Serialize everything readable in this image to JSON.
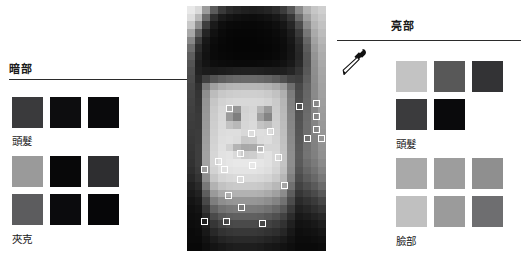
{
  "canvas": {
    "width": 528,
    "height": 261,
    "background": "#ffffff"
  },
  "sections": {
    "dark": {
      "heading": "暗部",
      "groups": [
        {
          "label": "頭髮",
          "rows": [
            [
              "#3a3a3c",
              "#0d0d0f",
              "#0a0a0c"
            ]
          ]
        },
        {
          "label": "夾克",
          "rows": [
            [
              "#9a9a9a",
              "#080809",
              "#2e2e30"
            ],
            [
              "#5c5c5e",
              "#0b0b0d",
              "#060608"
            ]
          ]
        }
      ]
    },
    "light": {
      "heading": "亮部",
      "groups": [
        {
          "label": "頭髮",
          "rows": [
            [
              "#c3c3c3",
              "#585858",
              "#333335"
            ],
            [
              "#3b3b3d",
              "#0a0a0c"
            ]
          ]
        },
        {
          "label": "臉部",
          "rows": [
            [
              "#a9a9a9",
              "#9d9d9d",
              "#8f8f8f"
            ],
            [
              "#c0c0c0",
              "#9b9b9b",
              "#6e6e70"
            ]
          ]
        }
      ]
    }
  },
  "portrait": {
    "name": "pixelated-portrait",
    "columns": 18,
    "rows": 32,
    "pixels": [
      "#e9e9e9",
      "#dadada",
      "#9b9b9b",
      "#5b5b5b",
      "#3a3a3a",
      "#2a2a2a",
      "#242424",
      "#202020",
      "#1e1e1e",
      "#202020",
      "#242424",
      "#2c2c2c",
      "#3c3c3c",
      "#565656",
      "#8a8a8a",
      "#b2b2b2",
      "#c6c6c6",
      "#cfcfcf",
      "#dedede",
      "#b9b9b9",
      "#6a6a6a",
      "#2f2f2f",
      "#1b1b1b",
      "#141414",
      "#101010",
      "#0e0e0e",
      "#0d0d0d",
      "#0f0f0f",
      "#121212",
      "#181818",
      "#222222",
      "#363636",
      "#6a6a6a",
      "#9e9e9e",
      "#bdbdbd",
      "#c8c8c8",
      "#c8c8c8",
      "#8f8f8f",
      "#3d3d3d",
      "#1a1a1a",
      "#0e0e0e",
      "#0a0a0a",
      "#090909",
      "#080808",
      "#080808",
      "#090909",
      "#0b0b0b",
      "#0f0f0f",
      "#161616",
      "#262626",
      "#4c4c4c",
      "#8a8a8a",
      "#b4b4b4",
      "#c2c2c2",
      "#a8a8a8",
      "#5f5f5f",
      "#242424",
      "#111111",
      "#0a0a0a",
      "#070707",
      "#060606",
      "#060606",
      "#060606",
      "#070707",
      "#080808",
      "#0b0b0b",
      "#101010",
      "#1c1c1c",
      "#3a3a3a",
      "#767676",
      "#aaaaaa",
      "#bcbcbc",
      "#888888",
      "#3e3e3e",
      "#181818",
      "#0c0c0c",
      "#080808",
      "#060606",
      "#050505",
      "#050505",
      "#050505",
      "#060606",
      "#070707",
      "#090909",
      "#0d0d0d",
      "#171717",
      "#2f2f2f",
      "#666666",
      "#a2a2a2",
      "#b6b6b6",
      "#6e6e6e",
      "#2c2c2c",
      "#141414",
      "#0a0a0a",
      "#070707",
      "#060606",
      "#050505",
      "#050505",
      "#050505",
      "#050505",
      "#060606",
      "#080808",
      "#0c0c0c",
      "#141414",
      "#292929",
      "#5c5c5c",
      "#9a9a9a",
      "#b0b0b0",
      "#5e5e5e",
      "#242424",
      "#121212",
      "#0a0a0a",
      "#080808",
      "#070707",
      "#060606",
      "#060606",
      "#060606",
      "#060606",
      "#070707",
      "#090909",
      "#0d0d0d",
      "#151515",
      "#272727",
      "#565656",
      "#949494",
      "#acacac",
      "#545454",
      "#202020",
      "#141414",
      "#0e0e0e",
      "#0c0c0c",
      "#0b0b0b",
      "#0a0a0a",
      "#0a0a0a",
      "#0a0a0a",
      "#0b0b0b",
      "#0c0c0c",
      "#0e0e0e",
      "#121212",
      "#191919",
      "#2a2a2a",
      "#545454",
      "#909090",
      "#a9a9a9",
      "#4e4e4e",
      "#222222",
      "#1c1c1c",
      "#1a1a1a",
      "#1c1c1c",
      "#1e1e1e",
      "#202020",
      "#212121",
      "#212121",
      "#202020",
      "#1e1e1e",
      "#1d1d1d",
      "#1f1f1f",
      "#252525",
      "#343434",
      "#585858",
      "#8e8e8e",
      "#a6a6a6",
      "#4a4a4a",
      "#282828",
      "#404040",
      "#545454",
      "#5e5e5e",
      "#646464",
      "#686868",
      "#6a6a6a",
      "#6a6a6a",
      "#686868",
      "#646464",
      "#5c5c5c",
      "#505050",
      "#424242",
      "#3e3e3e",
      "#5e5e5e",
      "#8c8c8c",
      "#a4a4a4",
      "#464646",
      "#303030",
      "#7a7a7a",
      "#a0a0a0",
      "#aeaeae",
      "#b4b4b4",
      "#b6b6b6",
      "#b7b7b7",
      "#b7b7b7",
      "#b6b6b6",
      "#b2b2b2",
      "#aaaaaa",
      "#9a9a9a",
      "#6e6e6e",
      "#484848",
      "#646464",
      "#8a8a8a",
      "#a2a2a2",
      "#444444",
      "#343434",
      "#8e8e8e",
      "#bcbcbc",
      "#c8c8c8",
      "#cccccc",
      "#cecece",
      "#cfcfcf",
      "#cfcfcf",
      "#cecece",
      "#cacaca",
      "#c2c2c2",
      "#b0b0b0",
      "#7c7c7c",
      "#4c4c4c",
      "#666666",
      "#8a8a8a",
      "#a0a0a0",
      "#424242",
      "#363636",
      "#949494",
      "#c6c6c6",
      "#d2d2d2",
      "#d6d6d6",
      "#d8d8d8",
      "#d8d8d8",
      "#d8d8d8",
      "#d7d7d7",
      "#d3d3d3",
      "#cacaca",
      "#b6b6b6",
      "#808080",
      "#4e4e4e",
      "#686868",
      "#888888",
      "#9e9e9e",
      "#404040",
      "#383838",
      "#969696",
      "#cacaca",
      "#d6d6d6",
      "#b0b0b0",
      "#969696",
      "#d2d2d2",
      "#d6d6d6",
      "#b6b6b6",
      "#9a9a9a",
      "#cccccc",
      "#b8b8b8",
      "#828282",
      "#505050",
      "#6a6a6a",
      "#868686",
      "#9c9c9c",
      "#3e3e3e",
      "#3a3a3a",
      "#989898",
      "#cccccc",
      "#d8d8d8",
      "#9a9a9a",
      "#7e7e7e",
      "#d4d4d4",
      "#d8d8d8",
      "#a0a0a0",
      "#848484",
      "#cecece",
      "#bababa",
      "#848484",
      "#525252",
      "#6c6c6c",
      "#858585",
      "#9a9a9a",
      "#3c3c3c",
      "#3a3a3a",
      "#9a9a9a",
      "#cecece",
      "#dadada",
      "#c2c2c2",
      "#b8b8b8",
      "#d6d6d6",
      "#dadada",
      "#c4c4c4",
      "#bcbcbc",
      "#d0d0d0",
      "#bcbcbc",
      "#868686",
      "#545454",
      "#6e6e6e",
      "#848484",
      "#989898",
      "#3a3a3a",
      "#3c3c3c",
      "#9c9c9c",
      "#d0d0d0",
      "#dcdcdc",
      "#dedede",
      "#dedede",
      "#d8d8d8",
      "#dcdcdc",
      "#dedede",
      "#dcdcdc",
      "#d2d2d2",
      "#bebebe",
      "#888888",
      "#565656",
      "#6e6e6e",
      "#838383",
      "#969696",
      "#383838",
      "#3c3c3c",
      "#9e9e9e",
      "#d2d2d2",
      "#dedede",
      "#e0e0e0",
      "#dcdcdc",
      "#c8c8c8",
      "#cacaca",
      "#dcdcdc",
      "#dedede",
      "#d4d4d4",
      "#c0c0c0",
      "#8a8a8a",
      "#585858",
      "#707070",
      "#828282",
      "#949494",
      "#363636",
      "#3e3e3e",
      "#a0a0a0",
      "#d4d4d4",
      "#e0e0e0",
      "#d2d2d2",
      "#b4b4b4",
      "#a8a8a8",
      "#aaaaaa",
      "#b8b8b8",
      "#d6d6d6",
      "#d6d6d6",
      "#c2c2c2",
      "#8c8c8c",
      "#5a5a5a",
      "#727272",
      "#818181",
      "#929292",
      "#343434",
      "#3e3e3e",
      "#a2a2a2",
      "#d6d6d6",
      "#e2e2e2",
      "#e4e4e4",
      "#dadada",
      "#cccccc",
      "#cecece",
      "#dcdcdc",
      "#e2e2e2",
      "#d8d8d8",
      "#c4c4c4",
      "#8e8e8e",
      "#5c5c5c",
      "#747474",
      "#808080",
      "#909090",
      "#323232",
      "#3e3e3e",
      "#a2a2a2",
      "#d6d6d6",
      "#e2e2e2",
      "#e6e6e6",
      "#e8e8e8",
      "#e8e8e8",
      "#e8e8e8",
      "#e6e6e6",
      "#e2e2e2",
      "#d8d8d8",
      "#c4c4c4",
      "#8e8e8e",
      "#5a5a5a",
      "#6e6e6e",
      "#7a7a7a",
      "#8a8a8a",
      "#2e2e2e",
      "#3a3a3a",
      "#9c9c9c",
      "#d2d2d2",
      "#dedede",
      "#e2e2e2",
      "#e4e4e4",
      "#e4e4e4",
      "#e4e4e4",
      "#e2e2e2",
      "#dedede",
      "#d4d4d4",
      "#c0c0c0",
      "#8a8a8a",
      "#545454",
      "#666666",
      "#727272",
      "#828282",
      "#282828",
      "#343434",
      "#8e8e8e",
      "#c6c6c6",
      "#d4d4d4",
      "#d8d8d8",
      "#dadada",
      "#dadada",
      "#dadada",
      "#d8d8d8",
      "#d4d4d4",
      "#cacaca",
      "#b6b6b6",
      "#808080",
      "#4c4c4c",
      "#5c5c5c",
      "#686868",
      "#787878",
      "#202020",
      "#2a2a2a",
      "#787878",
      "#b2b2b2",
      "#c2c2c2",
      "#c8c8c8",
      "#cacaca",
      "#cacaca",
      "#cacaca",
      "#c8c8c8",
      "#c2c2c2",
      "#b8b8b8",
      "#a4a4a4",
      "#707070",
      "#424242",
      "#4e4e4e",
      "#5a5a5a",
      "#6a6a6a",
      "#1a1a1a",
      "#222222",
      "#5e5e5e",
      "#9a9a9a",
      "#aaaaaa",
      "#b0b0b0",
      "#b2b2b2",
      "#b2b2b2",
      "#b2b2b2",
      "#b0b0b0",
      "#aaaaaa",
      "#a0a0a0",
      "#8c8c8c",
      "#5e5e5e",
      "#363636",
      "#404040",
      "#4a4a4a",
      "#585858",
      "#141414",
      "#1a1a1a",
      "#484848",
      "#7e7e7e",
      "#8e8e8e",
      "#949494",
      "#969696",
      "#969696",
      "#969696",
      "#949494",
      "#8e8e8e",
      "#848484",
      "#727272",
      "#4c4c4c",
      "#2a2a2a",
      "#323232",
      "#3a3a3a",
      "#464646",
      "#101010",
      "#141414",
      "#363636",
      "#626262",
      "#727272",
      "#787878",
      "#7a7a7a",
      "#7a7a7a",
      "#7a7a7a",
      "#787878",
      "#727272",
      "#686868",
      "#585858",
      "#3a3a3a",
      "#202020",
      "#262626",
      "#2e2e2e",
      "#363636",
      "#0e0e0e",
      "#101010",
      "#282828",
      "#4a4a4a",
      "#585858",
      "#5e5e5e",
      "#606060",
      "#606060",
      "#606060",
      "#5e5e5e",
      "#585858",
      "#505050",
      "#424242",
      "#2c2c2c",
      "#181818",
      "#1c1c1c",
      "#222222",
      "#282828",
      "#0c0c0c",
      "#0e0e0e",
      "#1e1e1e",
      "#363636",
      "#424242",
      "#484848",
      "#4a4a4a",
      "#4a4a4a",
      "#4a4a4a",
      "#484848",
      "#424242",
      "#3c3c3c",
      "#323232",
      "#202020",
      "#121212",
      "#141414",
      "#181818",
      "#1e1e1e",
      "#0a0a0a",
      "#0c0c0c",
      "#181818",
      "#282828",
      "#323232",
      "#363636",
      "#383838",
      "#383838",
      "#383838",
      "#363636",
      "#323232",
      "#2e2e2e",
      "#262626",
      "#181818",
      "#0e0e0e",
      "#101010",
      "#121212",
      "#161616",
      "#0a0a0a",
      "#0a0a0a",
      "#121212",
      "#1c1c1c",
      "#242424",
      "#282828",
      "#2a2a2a",
      "#2a2a2a",
      "#2a2a2a",
      "#282828",
      "#242424",
      "#202020",
      "#1a1a1a",
      "#121212",
      "#0c0c0c",
      "#0c0c0c",
      "#0e0e0e",
      "#101010",
      "#080808",
      "#080808",
      "#0e0e0e",
      "#141414",
      "#181818",
      "#1c1c1c",
      "#1e1e1e",
      "#1e1e1e",
      "#1e1e1e",
      "#1c1c1c",
      "#181818",
      "#161616",
      "#121212",
      "#0e0e0e",
      "#0a0a0a",
      "#0a0a0a",
      "#0a0a0a",
      "#0c0c0c"
    ],
    "markers": [
      {
        "x": 39,
        "y": 99
      },
      {
        "x": 109,
        "y": 97
      },
      {
        "x": 126,
        "y": 94
      },
      {
        "x": 126,
        "y": 107
      },
      {
        "x": 126,
        "y": 120
      },
      {
        "x": 117,
        "y": 129
      },
      {
        "x": 131,
        "y": 129
      },
      {
        "x": 61,
        "y": 124
      },
      {
        "x": 80,
        "y": 122
      },
      {
        "x": 50,
        "y": 144
      },
      {
        "x": 28,
        "y": 152
      },
      {
        "x": 14,
        "y": 160
      },
      {
        "x": 34,
        "y": 160
      },
      {
        "x": 62,
        "y": 156
      },
      {
        "x": 70,
        "y": 140
      },
      {
        "x": 88,
        "y": 148
      },
      {
        "x": 50,
        "y": 170
      },
      {
        "x": 38,
        "y": 186
      },
      {
        "x": 51,
        "y": 198
      },
      {
        "x": 14,
        "y": 212
      },
      {
        "x": 36,
        "y": 212
      },
      {
        "x": 72,
        "y": 214
      },
      {
        "x": 94,
        "y": 176
      }
    ]
  },
  "tool": {
    "name": "eyedropper",
    "label": "滴管"
  }
}
